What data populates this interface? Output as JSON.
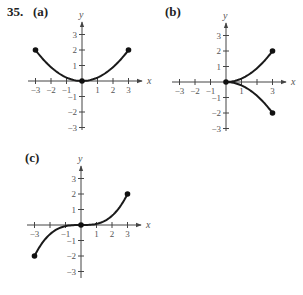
{
  "problem": {
    "number": "35."
  },
  "panels": [
    {
      "label": "(a)",
      "xvar": "x",
      "yvar": "y"
    },
    {
      "label": "(b)",
      "xvar": "x",
      "yvar": "y"
    },
    {
      "label": "(c)",
      "xvar": "x",
      "yvar": "y"
    }
  ],
  "chart_data": [
    {
      "type": "line",
      "title": "(a)",
      "xlabel": "x",
      "ylabel": "y",
      "xlim": [
        -3,
        3
      ],
      "ylim": [
        -3,
        3
      ],
      "x_ticks": [
        -3,
        -2,
        -1,
        1,
        2,
        3
      ],
      "x_tick_labels": [
        "-3",
        "-2",
        "-1",
        "1",
        "2",
        "3"
      ],
      "y_ticks": [
        -3,
        -2,
        -1,
        1,
        2,
        3
      ],
      "y_tick_labels": [
        "-3",
        "-2",
        "-1",
        "1",
        "2",
        "3"
      ],
      "grid": false,
      "series": [
        {
          "name": "curve",
          "x": [
            -3,
            -2,
            -1,
            0,
            1,
            2,
            3
          ],
          "y": [
            2,
            0.889,
            0.222,
            0,
            0.222,
            0.889,
            2
          ]
        }
      ],
      "points": [
        {
          "x": -3,
          "y": 2
        },
        {
          "x": 0,
          "y": 0
        },
        {
          "x": 3,
          "y": 2
        }
      ]
    },
    {
      "type": "line",
      "title": "(b)",
      "xlabel": "x",
      "ylabel": "y",
      "xlim": [
        -3,
        3
      ],
      "ylim": [
        -3,
        3
      ],
      "x_ticks": [
        -3,
        -2,
        -1,
        1,
        2,
        3
      ],
      "x_tick_labels": [
        "-3",
        "-2",
        "-1",
        "1",
        "3"
      ],
      "y_ticks": [
        -3,
        -2,
        -1,
        1,
        2,
        3
      ],
      "y_tick_labels": [
        "-3",
        "-2",
        "-1",
        "1",
        "2",
        "3"
      ],
      "grid": false,
      "series": [
        {
          "name": "upper branch",
          "x": [
            0,
            1,
            2,
            3
          ],
          "y": [
            0,
            0.222,
            0.889,
            2
          ]
        },
        {
          "name": "lower branch",
          "x": [
            0,
            1,
            2,
            3
          ],
          "y": [
            0,
            -0.222,
            -0.889,
            -2
          ]
        }
      ],
      "points": [
        {
          "x": 0,
          "y": 0
        },
        {
          "x": 3,
          "y": 2
        },
        {
          "x": 3,
          "y": -2
        }
      ]
    },
    {
      "type": "line",
      "title": "(c)",
      "xlabel": "x",
      "ylabel": "y",
      "xlim": [
        -3,
        3
      ],
      "ylim": [
        -3,
        3
      ],
      "x_ticks": [
        -3,
        -2,
        -1,
        1,
        2,
        3
      ],
      "x_tick_labels": [
        "-3",
        "-1",
        "1",
        "2",
        "3"
      ],
      "y_ticks": [
        -3,
        -2,
        -1,
        1,
        2,
        3
      ],
      "y_tick_labels": [
        "-3",
        "-2",
        "-1",
        "1",
        "2",
        "3"
      ],
      "grid": false,
      "series": [
        {
          "name": "curve",
          "x": [
            -3,
            -2,
            -1,
            0,
            1,
            2,
            3
          ],
          "y": [
            -2,
            -0.593,
            -0.074,
            0,
            0.074,
            0.593,
            2
          ]
        }
      ],
      "points": [
        {
          "x": -3,
          "y": -2
        },
        {
          "x": 0,
          "y": 0
        },
        {
          "x": 3,
          "y": 2
        }
      ]
    }
  ]
}
